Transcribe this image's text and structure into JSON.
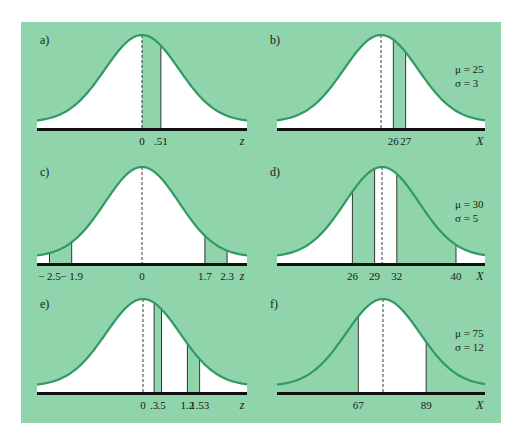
{
  "colors": {
    "background": "#8fd4aa",
    "curve": "#2f9a63",
    "fill_white": "#ffffff",
    "fill_shade": "#8fd4aa",
    "axis": "#111111",
    "line": "#222222"
  },
  "chart_data": [
    {
      "panel": "a)",
      "type": "area",
      "title": "",
      "distribution": "standard normal",
      "xlabel": "z",
      "mean": 0,
      "sd": 1,
      "mean_line": "dashed",
      "tick_values": [
        0,
        0.51
      ],
      "tick_labels": [
        "0",
        ".51"
      ],
      "cut_lines": [
        0.51
      ],
      "shaded_intervals": [
        [
          0,
          0.51
        ]
      ],
      "params_text": [],
      "geom": {
        "cx": 142,
        "base": 128,
        "peak": 35,
        "sigma_px": 37,
        "xmin": 37,
        "xmax": 247
      }
    },
    {
      "panel": "b)",
      "type": "area",
      "distribution": "normal",
      "xlabel": "X",
      "mean": 25,
      "sd": 3,
      "mean_line": "dashed",
      "tick_values": [
        26,
        27
      ],
      "tick_labels": [
        "26",
        "27"
      ],
      "cut_lines": [
        26,
        27
      ],
      "shaded_intervals": [
        [
          26,
          27
        ]
      ],
      "params_text": [
        "μ = 25",
        "σ = 3"
      ],
      "geom": {
        "cx": 381,
        "base": 128,
        "peak": 35,
        "sigma_px": 37,
        "xmin": 277,
        "xmax": 485
      }
    },
    {
      "panel": "c)",
      "type": "area",
      "distribution": "standard normal",
      "xlabel": "z",
      "mean": 0,
      "sd": 1,
      "mean_line": "dashed",
      "tick_values": [
        -2.5,
        -1.9,
        0,
        1.7,
        2.3
      ],
      "tick_labels": [
        "− 2.5",
        "− 1.9",
        "0",
        "1.7",
        "2.3"
      ],
      "cut_lines": [
        -2.5,
        -1.9,
        1.7,
        2.3
      ],
      "shaded_intervals": [
        [
          -2.5,
          -1.9
        ],
        [
          1.7,
          2.3
        ]
      ],
      "params_text": [],
      "geom": {
        "cx": 142,
        "base": 263,
        "peak": 167,
        "sigma_px": 37,
        "xmin": 37,
        "xmax": 247
      }
    },
    {
      "panel": "d)",
      "type": "area",
      "distribution": "normal",
      "xlabel": "X",
      "mean": 30,
      "sd": 5,
      "mean_line": "dashed",
      "tick_values": [
        26,
        29,
        32,
        40
      ],
      "tick_labels": [
        "26",
        "29",
        "32",
        "40"
      ],
      "cut_lines": [
        26,
        29,
        32,
        40
      ],
      "shaded_intervals": [
        [
          26,
          29
        ],
        [
          32,
          40
        ]
      ],
      "params_text": [
        "μ = 30",
        "σ = 5"
      ],
      "geom": {
        "cx": 382,
        "base": 263,
        "peak": 167,
        "sigma_px": 37,
        "xmin": 277,
        "xmax": 485
      }
    },
    {
      "panel": "e)",
      "type": "area",
      "distribution": "standard normal",
      "xlabel": "z",
      "mean": 0,
      "sd": 1,
      "mean_line": "dashed",
      "tick_values": [
        0,
        0.3,
        0.5,
        1.2,
        1.53
      ],
      "tick_labels": [
        "0",
        ".3",
        ".5",
        "1.2",
        "1.53"
      ],
      "cut_lines": [
        0.3,
        0.5,
        1.2,
        1.53
      ],
      "shaded_intervals": [
        [
          0.3,
          0.5
        ],
        [
          1.2,
          1.53
        ]
      ],
      "params_text": [],
      "geom": {
        "cx": 143,
        "base": 392,
        "peak": 299,
        "sigma_px": 37,
        "xmin": 37,
        "xmax": 247
      }
    },
    {
      "panel": "f)",
      "type": "area",
      "distribution": "normal",
      "xlabel": "X",
      "mean": 75,
      "sd": 12,
      "mean_line": "dashed",
      "tick_values": [
        67,
        89
      ],
      "tick_labels": [
        "67",
        "89"
      ],
      "cut_lines": [
        67,
        89
      ],
      "shaded_intervals": [
        [
          "-inf",
          67
        ],
        [
          89,
          "inf"
        ]
      ],
      "white_intervals": [
        [
          67,
          89
        ]
      ],
      "params_text": [
        "μ = 75",
        "σ = 12"
      ],
      "geom": {
        "cx": 383,
        "base": 392,
        "peak": 299,
        "sigma_px": 37,
        "xmin": 277,
        "xmax": 485
      }
    }
  ]
}
